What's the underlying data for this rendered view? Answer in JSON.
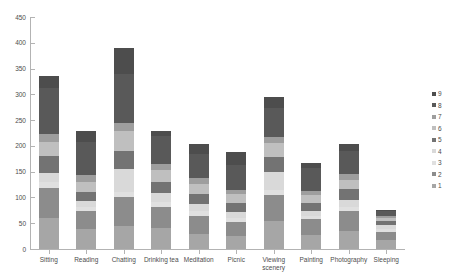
{
  "chart_data": {
    "type": "bar",
    "stacked": true,
    "title": "",
    "subtitle": "",
    "xlabel": "",
    "ylabel": "",
    "ylim": [
      0,
      450
    ],
    "ytick_step": 50,
    "yticks": [
      0,
      50,
      100,
      150,
      200,
      250,
      300,
      350,
      400,
      450
    ],
    "ytick_labels": [
      "0",
      "50",
      "100",
      "150",
      "200",
      "250",
      "300",
      "350",
      "400",
      "450"
    ],
    "grid": false,
    "legend_position": "right",
    "categories": [
      "Sitting",
      "Reading",
      "Chatting",
      "Drinking tea",
      "Meditation",
      "Picnic",
      "Viewing\nscenery",
      "Painting",
      "Photography",
      "Sleeping"
    ],
    "series": [
      {
        "name": "1",
        "color": "#a6a6a6",
        "values": [
          60,
          38,
          45,
          40,
          30,
          25,
          55,
          28,
          35,
          18
        ]
      },
      {
        "name": "2",
        "color": "#8c8c8c",
        "values": [
          58,
          35,
          55,
          42,
          35,
          28,
          50,
          30,
          38,
          16
        ]
      },
      {
        "name": "3",
        "color": "#e0e0e0",
        "values": [
          12,
          8,
          10,
          9,
          8,
          7,
          10,
          6,
          9,
          5
        ]
      },
      {
        "name": "4",
        "color": "#d9d9d9",
        "values": [
          18,
          12,
          45,
          18,
          14,
          12,
          35,
          10,
          14,
          7
        ]
      },
      {
        "name": "5",
        "color": "#737373",
        "values": [
          32,
          18,
          35,
          22,
          20,
          18,
          28,
          16,
          20,
          8
        ]
      },
      {
        "name": "6",
        "color": "#bfbfbf",
        "values": [
          28,
          20,
          40,
          22,
          20,
          16,
          28,
          14,
          18,
          7
        ]
      },
      {
        "name": "7",
        "color": "#9e9e9e",
        "values": [
          15,
          12,
          15,
          12,
          10,
          9,
          12,
          9,
          11,
          4
        ]
      },
      {
        "name": "8",
        "color": "#595959",
        "values": [
          90,
          65,
          95,
          55,
          48,
          48,
          55,
          45,
          45,
          8
        ]
      },
      {
        "name": "9",
        "color": "#4d4d4d",
        "values": [
          22,
          22,
          50,
          10,
          18,
          25,
          22,
          10,
          13,
          2
        ]
      }
    ],
    "totals": [
      335,
      230,
      390,
      230,
      203,
      188,
      285,
      168,
      203,
      75
    ]
  },
  "legend": {
    "entries": [
      {
        "label": "9",
        "color": "#4d4d4d"
      },
      {
        "label": "8",
        "color": "#595959"
      },
      {
        "label": "7",
        "color": "#9e9e9e"
      },
      {
        "label": "6",
        "color": "#bfbfbf"
      },
      {
        "label": "5",
        "color": "#737373"
      },
      {
        "label": "4",
        "color": "#d9d9d9"
      },
      {
        "label": "3",
        "color": "#e0e0e0"
      },
      {
        "label": "2",
        "color": "#8c8c8c"
      },
      {
        "label": "1",
        "color": "#a6a6a6"
      }
    ]
  },
  "colors": {
    "background": "#ffffff",
    "axis": "#b3b3b3",
    "text": "#4d4d4d"
  }
}
